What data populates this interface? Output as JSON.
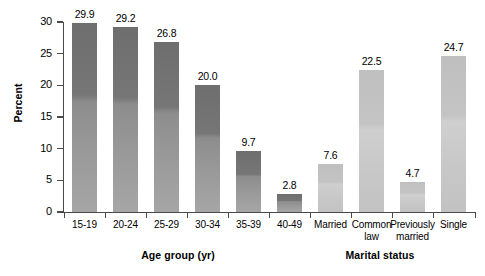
{
  "chart_data": {
    "type": "bar",
    "title": "",
    "xlabel": "",
    "ylabel": "Percent",
    "ylim": [
      0,
      30
    ],
    "ytick_values": [
      0,
      5,
      10,
      15,
      20,
      25,
      30
    ],
    "ytick_labels": [
      "0",
      "5",
      "10",
      "15",
      "20",
      "25",
      "30"
    ],
    "grid": false,
    "legend": "none",
    "groups": [
      {
        "name": "age-group",
        "axis_title": "Age group (yr)",
        "color": "#8a8a8a",
        "categories": [
          "15-19",
          "20-24",
          "25-29",
          "30-34",
          "35-39",
          "40-49"
        ],
        "values": [
          29.9,
          29.2,
          26.8,
          20.0,
          9.7,
          2.8
        ],
        "value_labels": [
          "29.9",
          "29.2",
          "26.8",
          "20.0",
          "9.7",
          "2.8"
        ]
      },
      {
        "name": "marital-status",
        "axis_title": "Marital status",
        "color": "#c6c6c6",
        "categories": [
          "Married",
          "Common law",
          "Previously married",
          "Single"
        ],
        "category_lines": [
          [
            "Married"
          ],
          [
            "Common",
            "law"
          ],
          [
            "Previously",
            "married"
          ],
          [
            "Single"
          ]
        ],
        "values": [
          7.6,
          22.5,
          4.7,
          24.7
        ],
        "value_labels": [
          "7.6",
          "22.5",
          "4.7",
          "24.7"
        ]
      }
    ]
  },
  "axes": {
    "y_title": "Percent",
    "x_titles": [
      "Age group (yr)",
      "Marital status"
    ]
  }
}
